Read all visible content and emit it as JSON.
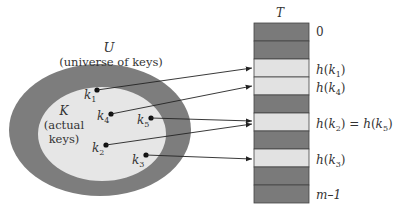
{
  "diagram": {
    "universe": {
      "symbol": "U",
      "caption": "(universe of keys)"
    },
    "actual": {
      "symbol": "K",
      "caption_line1": "(actual",
      "caption_line2": "keys)"
    },
    "table": {
      "title": "T",
      "rows": [
        {
          "label": "0",
          "filled": false
        },
        {
          "label": "",
          "filled": false
        },
        {
          "label": "h(k1)",
          "filled": true
        },
        {
          "label": "h(k4)",
          "filled": true
        },
        {
          "label": "",
          "filled": false
        },
        {
          "label": "h(k2) = h(k5)",
          "filled": true
        },
        {
          "label": "",
          "filled": false
        },
        {
          "label": "h(k3)",
          "filled": true
        },
        {
          "label": "",
          "filled": false
        },
        {
          "label": "m–1",
          "filled": false
        }
      ]
    },
    "keys": [
      {
        "name": "k1",
        "sub": "1",
        "target_row": 2
      },
      {
        "name": "k4",
        "sub": "4",
        "target_row": 3
      },
      {
        "name": "k5",
        "sub": "5",
        "target_row": 5
      },
      {
        "name": "k2",
        "sub": "2",
        "target_row": 5
      },
      {
        "name": "k3",
        "sub": "3",
        "target_row": 7
      }
    ],
    "colors": {
      "dark": "#7a7a7a",
      "light": "#e2e2e2",
      "outer": "#7d7d7d",
      "inner": "#e6e6e6"
    }
  }
}
